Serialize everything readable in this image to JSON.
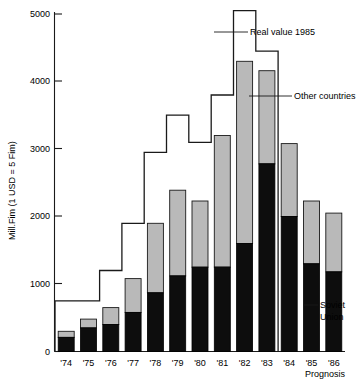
{
  "chart_data": {
    "type": "bar",
    "title": "",
    "subtitle": "",
    "xlabel": "Prognosis",
    "ylabel": "Mill.Fim (1 USD = 5 Fim)",
    "categories": [
      "'74",
      "'75",
      "'76",
      "'77",
      "'78",
      "'79",
      "'80",
      "'81",
      "'82",
      "'83",
      "'84",
      "'85",
      "'86"
    ],
    "ylim": [
      0,
      5200
    ],
    "yticks": [
      0,
      1000,
      2000,
      3000,
      4000,
      5000
    ],
    "ytick_labels": [
      "0",
      "1000",
      "2000",
      "3000",
      "4000",
      "5000"
    ],
    "grid": false,
    "legend_position": "annotations-right",
    "stacked": true,
    "series": [
      {
        "name": "Soviet Union",
        "color": "#0d0d0d",
        "values": [
          210,
          350,
          400,
          580,
          870,
          1120,
          1250,
          1250,
          1600,
          2780,
          2000,
          1300,
          1180
        ]
      },
      {
        "name": "Other countries",
        "color": "#b9b9b9",
        "values": [
          90,
          130,
          250,
          500,
          1030,
          1270,
          980,
          1950,
          2700,
          1380,
          1080,
          930,
          870
        ]
      }
    ],
    "totals": [
      300,
      480,
      650,
      1080,
      1900,
      2390,
      2230,
      3200,
      4300,
      4160,
      3080,
      2230,
      2050
    ],
    "overlay": {
      "name": "Real value 1985",
      "type": "step",
      "values": [
        750,
        750,
        1200,
        1900,
        2950,
        3500,
        3100,
        3800,
        5050,
        4450,
        null,
        null,
        null
      ]
    },
    "annotations": [
      {
        "label": "Real value 1985",
        "target_series": "overlay"
      },
      {
        "label": "Other countries",
        "target_series": "Other countries"
      },
      {
        "label": "Soviet Union",
        "target_series": "Soviet Union",
        "lines": [
          "Soviet",
          "Union"
        ]
      }
    ]
  },
  "axis": {
    "y_title": "Mill.Fim (1 USD = 5 Fim)",
    "x_note": "Prognosis"
  }
}
